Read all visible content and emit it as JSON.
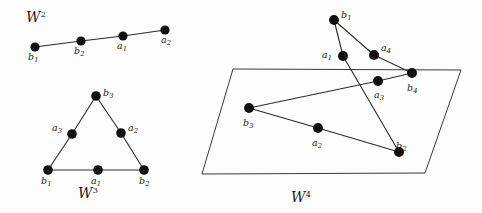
{
  "figure": {
    "width": 482,
    "height": 213,
    "background": "#fdfdfd",
    "ink": "#1b1b1b"
  },
  "panels": [
    {
      "id": "w2",
      "name": "W-squared-panel",
      "label_w": "W",
      "label_exp": "2",
      "label_x": 26,
      "label_y": 10,
      "nodes": [
        {
          "id": "b1",
          "base": "b",
          "sub": "1",
          "x": 35,
          "y": 47,
          "r": 4.6,
          "lx": 28,
          "ly": 52
        },
        {
          "id": "b2",
          "base": "b",
          "sub": "2",
          "x": 81,
          "y": 41,
          "r": 4.6,
          "lx": 74,
          "ly": 46
        },
        {
          "id": "a1",
          "base": "a",
          "sub": "1",
          "x": 123,
          "y": 36,
          "r": 4.6,
          "lx": 117,
          "ly": 41
        },
        {
          "id": "a2",
          "base": "a",
          "sub": "2",
          "x": 165,
          "y": 30,
          "r": 4.6,
          "lx": 161,
          "ly": 35
        }
      ],
      "edges": [
        {
          "from": "b1",
          "to": "b2"
        },
        {
          "from": "b2",
          "to": "a1"
        },
        {
          "from": "a1",
          "to": "a2"
        }
      ]
    },
    {
      "id": "w3",
      "name": "W-cubed-panel",
      "label_w": "W",
      "label_exp": "3",
      "label_x": 78,
      "label_y": 186,
      "nodes": [
        {
          "id": "b3",
          "base": "b",
          "sub": "3",
          "x": 96,
          "y": 96,
          "r": 4.8,
          "lx": 103,
          "ly": 88
        },
        {
          "id": "a3",
          "base": "a",
          "sub": "3",
          "x": 72,
          "y": 134,
          "r": 4.8,
          "lx": 52,
          "ly": 123
        },
        {
          "id": "a2",
          "base": "a",
          "sub": "2",
          "x": 121,
          "y": 133,
          "r": 4.8,
          "lx": 128,
          "ly": 123
        },
        {
          "id": "b1",
          "base": "b",
          "sub": "1",
          "x": 48,
          "y": 170,
          "r": 4.8,
          "lx": 41,
          "ly": 176
        },
        {
          "id": "a1",
          "base": "a",
          "sub": "1",
          "x": 98,
          "y": 170,
          "r": 4.8,
          "lx": 91,
          "ly": 176
        },
        {
          "id": "b2",
          "base": "b",
          "sub": "2",
          "x": 144,
          "y": 170,
          "r": 4.8,
          "lx": 139,
          "ly": 176
        }
      ],
      "edges": [
        {
          "from": "b3",
          "to": "a3"
        },
        {
          "from": "a3",
          "to": "b1"
        },
        {
          "from": "b3",
          "to": "a2"
        },
        {
          "from": "a2",
          "to": "b2"
        },
        {
          "from": "b1",
          "to": "a1"
        },
        {
          "from": "a1",
          "to": "b2"
        }
      ]
    },
    {
      "id": "w4",
      "name": "W-fourth-panel",
      "label_w": "W",
      "label_exp": "4",
      "label_x": 291,
      "label_y": 190,
      "plane": [
        {
          "x": 233,
          "y": 69
        },
        {
          "x": 461,
          "y": 70
        },
        {
          "x": 425,
          "y": 173
        },
        {
          "x": 202,
          "y": 174
        }
      ],
      "nodes": [
        {
          "id": "b1",
          "base": "b",
          "sub": "1",
          "x": 334,
          "y": 20,
          "r": 5.0,
          "lx": 341,
          "ly": 10
        },
        {
          "id": "a1",
          "base": "a",
          "sub": "1",
          "x": 343,
          "y": 56,
          "r": 5.0,
          "lx": 322,
          "ly": 50
        },
        {
          "id": "a4",
          "base": "a",
          "sub": "4",
          "x": 374,
          "y": 55,
          "r": 5.0,
          "lx": 381,
          "ly": 43
        },
        {
          "id": "b4",
          "base": "b",
          "sub": "4",
          "x": 412,
          "y": 73,
          "r": 5.0,
          "lx": 407,
          "ly": 83
        },
        {
          "id": "a3",
          "base": "a",
          "sub": "3",
          "x": 378,
          "y": 81,
          "r": 5.0,
          "lx": 374,
          "ly": 90
        },
        {
          "id": "b3",
          "base": "b",
          "sub": "3",
          "x": 249,
          "y": 108,
          "r": 5.0,
          "lx": 243,
          "ly": 118
        },
        {
          "id": "a2",
          "base": "a",
          "sub": "2",
          "x": 318,
          "y": 128,
          "r": 5.0,
          "lx": 312,
          "ly": 138
        },
        {
          "id": "b2",
          "base": "b",
          "sub": "2",
          "x": 399,
          "y": 152,
          "r": 5.0,
          "lx": 396,
          "ly": 141
        }
      ],
      "edges": [
        {
          "from": "b1",
          "to": "a1"
        },
        {
          "from": "b1",
          "to": "a4"
        },
        {
          "from": "a4",
          "to": "b4"
        },
        {
          "from": "b4",
          "to": "a3"
        },
        {
          "from": "a3",
          "to": "b3"
        },
        {
          "from": "a1",
          "to": "b2"
        },
        {
          "from": "b3",
          "to": "a2"
        },
        {
          "from": "a2",
          "to": "b2"
        }
      ]
    }
  ]
}
